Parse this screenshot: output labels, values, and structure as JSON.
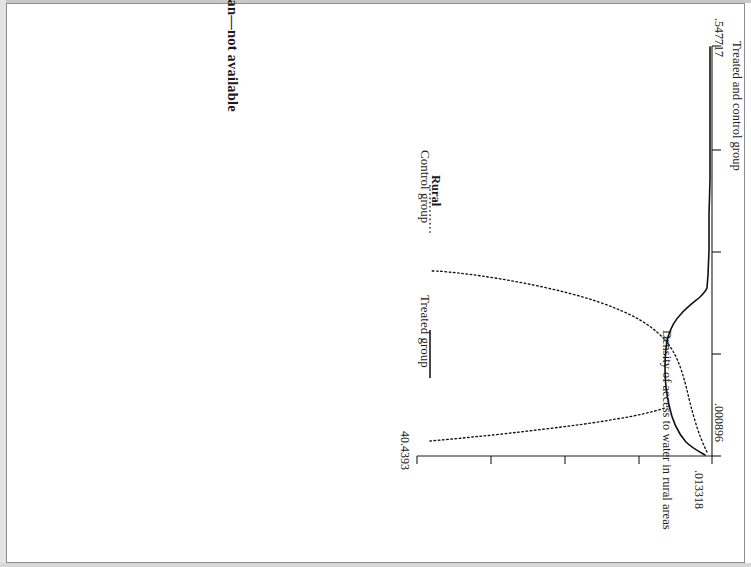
{
  "figure": {
    "top_heading": "Urban—not available",
    "panel_title": "Rural",
    "x_axis_title": "Treated and control group",
    "y_axis_title": "Density of access to water in rural areas",
    "legend": [
      {
        "label": "Treated group",
        "style": "solid"
      },
      {
        "label": "Control group",
        "style": "dotted"
      }
    ],
    "x_ticks": [
      ".000896",
      ".547717"
    ],
    "y_ticks": [
      ".013318",
      "40.4393"
    ],
    "orientation_degrees": 90
  },
  "chart_data": {
    "type": "line",
    "title": "Rural",
    "subtitle": "Urban—not available",
    "xlabel": "Treated and control group",
    "ylabel": "Density of access to water in rural areas",
    "xlim": [
      0.000896,
      0.547717
    ],
    "ylim": [
      0.013318,
      40.4393
    ],
    "xticks": [
      0.000896,
      0.547717
    ],
    "yticks": [
      0.013318,
      40.4393
    ],
    "grid": false,
    "legend_position": "top",
    "rotated_90_clockwise": true,
    "series": [
      {
        "name": "Treated group",
        "style": "solid",
        "x": [
          0.0009,
          0.003,
          0.0065,
          0.011,
          0.017,
          0.025,
          0.034,
          0.045,
          0.06,
          0.08,
          0.105,
          0.14,
          0.19,
          0.25,
          0.32,
          0.4,
          0.48,
          0.5477
        ],
        "y": [
          0.0133,
          6.4,
          13.2,
          16.5,
          15.8,
          13.0,
          10.0,
          7.3,
          5.0,
          3.2,
          2.0,
          1.2,
          0.7,
          0.42,
          0.26,
          0.17,
          0.11,
          0.08
        ]
      },
      {
        "name": "Control group",
        "style": "dotted",
        "x": [
          0.0009,
          0.0025,
          0.005,
          0.009,
          0.015,
          0.023,
          0.033,
          0.046,
          0.062,
          0.082,
          0.11,
          0.145,
          0.195,
          0.255,
          0.325,
          0.405,
          0.485,
          0.5477
        ],
        "y": [
          17.2,
          27.5,
          34.8,
          38.9,
          40.4393,
          38.2,
          33.5,
          27.8,
          21.5,
          15.4,
          10.2,
          6.2,
          3.3,
          1.7,
          0.9,
          0.5,
          0.3,
          0.2
        ]
      }
    ]
  }
}
